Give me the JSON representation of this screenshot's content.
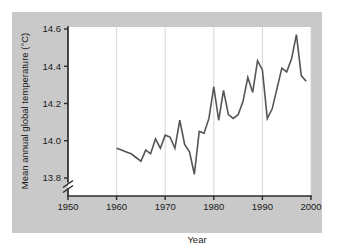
{
  "figure": {
    "background_color": "#ffffff",
    "panel_color": "#c9c9c9",
    "plot_background": "#ffffff",
    "line_color": "#555558",
    "axis_color": "#2b2b2b",
    "grid_color": "#d2d2d2"
  },
  "chart_data": {
    "type": "line",
    "title": "",
    "xlabel": "Year",
    "ylabel": "Mean annual global temperature (°C)",
    "xlim": [
      1950,
      2000
    ],
    "ylim": [
      13.72,
      14.62
    ],
    "xticks": [
      1950,
      1960,
      1970,
      1980,
      1990,
      2000
    ],
    "xticklabels": [
      "1950",
      "1960",
      "1970",
      "1980",
      "1990",
      "2000"
    ],
    "yticks": [
      13.8,
      14.0,
      14.2,
      14.4,
      14.6
    ],
    "yticklabels": [
      "13.8",
      "14.0",
      "14.2",
      "14.4",
      "14.6"
    ],
    "grid": "vertical-only",
    "axis_break": true,
    "axis_break_note": "y-axis broken below 13.8",
    "legend": "none",
    "series": [
      {
        "name": "Mean annual global temperature",
        "x": [
          1960,
          1961,
          1962,
          1963,
          1964,
          1965,
          1966,
          1967,
          1968,
          1969,
          1970,
          1971,
          1972,
          1973,
          1974,
          1975,
          1976,
          1977,
          1978,
          1979,
          1980,
          1981,
          1982,
          1983,
          1984,
          1985,
          1986,
          1987,
          1988,
          1989,
          1990,
          1991,
          1992,
          1993,
          1994,
          1995,
          1996,
          1997,
          1998,
          1999
        ],
        "values": [
          13.96,
          13.95,
          13.94,
          13.93,
          13.91,
          13.89,
          13.95,
          13.93,
          14.01,
          13.96,
          14.03,
          14.02,
          13.96,
          14.11,
          13.98,
          13.94,
          13.82,
          14.05,
          14.04,
          14.12,
          14.29,
          14.11,
          14.27,
          14.14,
          14.12,
          14.14,
          14.21,
          14.34,
          14.26,
          14.43,
          14.38,
          14.12,
          14.17,
          14.28,
          14.39,
          14.37,
          14.44,
          14.57,
          14.35,
          14.32
        ]
      }
    ]
  },
  "labels": {
    "y_axis_title": "Mean annual global temperature (°C)",
    "x_axis_title": "Year"
  }
}
